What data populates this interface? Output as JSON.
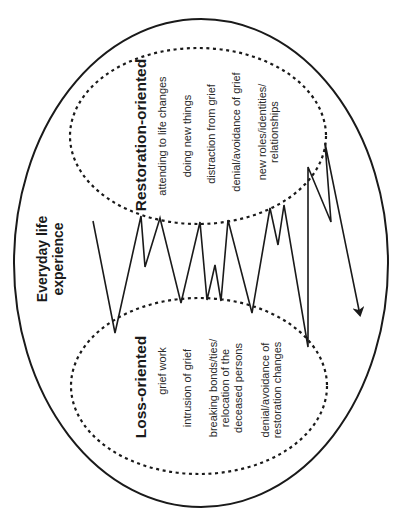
{
  "diagram": {
    "title": {
      "lines": [
        "Everyday life",
        "experience"
      ]
    },
    "restoration": {
      "heading": "Restoration-oriented",
      "items": [
        {
          "lines": [
            "attending to life changes"
          ]
        },
        {
          "lines": [
            "doing new things"
          ]
        },
        {
          "lines": [
            "distraction from grief"
          ]
        },
        {
          "lines": [
            "denial/avoidance of grief"
          ]
        },
        {
          "lines": [
            "new roles/identities/",
            "relationships"
          ]
        }
      ]
    },
    "loss": {
      "heading": "Loss-oriented",
      "items": [
        {
          "lines": [
            "grief work"
          ]
        },
        {
          "lines": [
            "intrusion of grief"
          ]
        },
        {
          "lines": [
            "breaking bonds/ties/",
            "relocation of the",
            "deceased persons"
          ]
        },
        {
          "lines": [
            "denial/avoidance of",
            "restoration changes"
          ]
        }
      ]
    },
    "colors": {
      "stroke": "#1a1a1a",
      "background": "#ffffff"
    }
  }
}
